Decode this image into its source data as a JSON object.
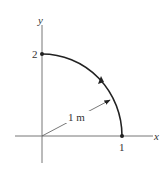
{
  "diagram": {
    "axes": {
      "x_label": "x",
      "y_label": "y"
    },
    "points": [
      {
        "label": "2",
        "position": "on y-axis"
      },
      {
        "label": "1",
        "position": "on x-axis"
      }
    ],
    "radius_label": "1 m",
    "colors": {
      "axis": "#777777",
      "curve": "#222222",
      "text": "#333333"
    }
  }
}
